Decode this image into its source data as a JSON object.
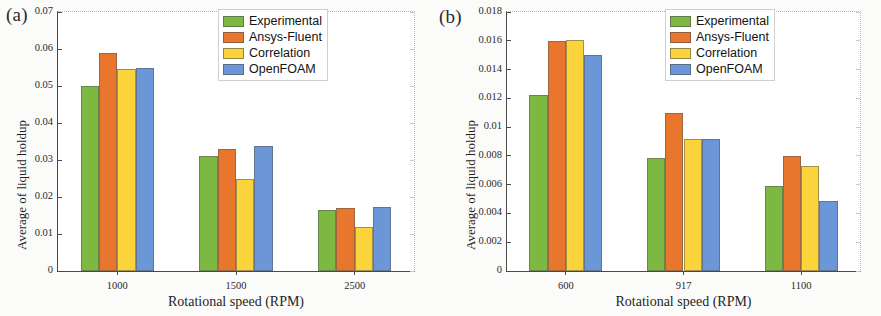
{
  "figure": {
    "background": "#fbfbfa",
    "series_colors": {
      "Experimental": "#7CB842",
      "Ansys-Fluent": "#E8762C",
      "Correlation": "#FBD43C",
      "OpenFOAM": "#6B97D8"
    }
  },
  "panels": [
    {
      "tag": "(a)",
      "ylabel": "Average of liquid holdup",
      "xlabel": "Rotational speed (RPM)",
      "yticks": [
        "0",
        "0.01",
        "0.02",
        "0.03",
        "0.04",
        "0.05",
        "0.06",
        "0.07"
      ],
      "xticks": [
        "1000",
        "1500",
        "2500"
      ],
      "legend": [
        "Experimental",
        "Ansys-Fluent",
        "Correlation",
        "OpenFOAM"
      ]
    },
    {
      "tag": "(b)",
      "ylabel": "Average of liquid holdup",
      "xlabel": "Rotational speed (RPM)",
      "yticks": [
        "0",
        "0.002",
        "0.004",
        "0.006",
        "0.008",
        "0.01",
        "0.012",
        "0.014",
        "0.016",
        "0.018"
      ],
      "xticks": [
        "600",
        "917",
        "1100"
      ],
      "legend": [
        "Experimental",
        "Ansys-Fluent",
        "Correlation",
        "OpenFOAM"
      ]
    }
  ],
  "chart_data": [
    {
      "type": "bar",
      "title": "(a)",
      "xlabel": "Rotational speed (RPM)",
      "ylabel": "Average of liquid holdup",
      "categories": [
        "1000",
        "1500",
        "2500"
      ],
      "ylim": [
        0,
        0.07
      ],
      "ytick_step": 0.01,
      "grid": false,
      "legend_position": "top-right",
      "series": [
        {
          "name": "Experimental",
          "color": "#7CB842",
          "values": [
            0.05,
            0.031,
            0.0165
          ]
        },
        {
          "name": "Ansys-Fluent",
          "color": "#E8762C",
          "values": [
            0.059,
            0.033,
            0.0171
          ]
        },
        {
          "name": "Correlation",
          "color": "#FBD43C",
          "values": [
            0.0545,
            0.025,
            0.0119
          ]
        },
        {
          "name": "OpenFOAM",
          "color": "#6B97D8",
          "values": [
            0.055,
            0.0338,
            0.0173
          ]
        }
      ]
    },
    {
      "type": "bar",
      "title": "(b)",
      "xlabel": "Rotational speed (RPM)",
      "ylabel": "Average of liquid holdup",
      "categories": [
        "600",
        "917",
        "1100"
      ],
      "ylim": [
        0,
        0.018
      ],
      "ytick_step": 0.002,
      "grid": false,
      "legend_position": "top-right",
      "series": [
        {
          "name": "Experimental",
          "color": "#7CB842",
          "values": [
            0.0122,
            0.00788,
            0.00588
          ]
        },
        {
          "name": "Ansys-Fluent",
          "color": "#E8762C",
          "values": [
            0.016,
            0.011,
            0.00798
          ]
        },
        {
          "name": "Correlation",
          "color": "#FBD43C",
          "values": [
            0.01608,
            0.00915,
            0.00727
          ]
        },
        {
          "name": "OpenFOAM",
          "color": "#6B97D8",
          "values": [
            0.015,
            0.0092,
            0.00488
          ]
        }
      ]
    }
  ]
}
